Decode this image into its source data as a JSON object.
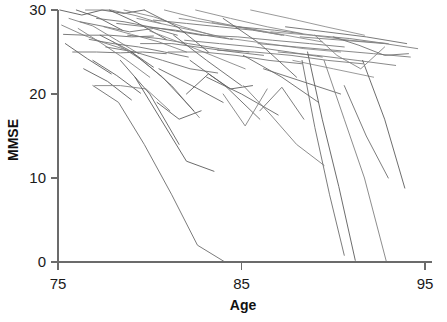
{
  "chart_data": {
    "type": "line",
    "title": "",
    "subtitle": "",
    "xlabel": "Age",
    "ylabel": "MMSE",
    "xlim": [
      75,
      95
    ],
    "ylim": [
      0,
      30
    ],
    "xticks": [
      75,
      85,
      95
    ],
    "yticks": [
      0,
      10,
      20,
      30
    ],
    "xticklabels": [
      "75",
      "85",
      "95"
    ],
    "yticklabels": [
      "0",
      "10",
      "20",
      "30"
    ],
    "grid": false,
    "legend": null,
    "legend_position": "none",
    "annotations": [],
    "line_color": "#707070",
    "line_width": 0.9,
    "n_series": 68,
    "series": [
      {
        "name": "s1",
        "x": [
          75.1,
          76.3,
          77.4,
          78.6,
          79.7
        ],
        "values": [
          30.0,
          29.4,
          30.0,
          29.6,
          30.0
        ]
      },
      {
        "name": "s2",
        "x": [
          75.2,
          76.4,
          77.5,
          78.8
        ],
        "values": [
          28.2,
          27.0,
          26.1,
          25.2
        ]
      },
      {
        "name": "s3",
        "x": [
          75.3,
          76.5,
          77.8,
          79.0,
          80.2
        ],
        "values": [
          27.1,
          27.0,
          27.0,
          26.8,
          26.9
        ]
      },
      {
        "name": "s4",
        "x": [
          75.4,
          76.6,
          77.9
        ],
        "values": [
          26.0,
          24.2,
          22.4
        ]
      },
      {
        "name": "s5",
        "x": [
          75.6,
          76.9,
          78.2,
          79.4
        ],
        "values": [
          29.0,
          28.1,
          26.4,
          24.8
        ]
      },
      {
        "name": "s6",
        "x": [
          75.8,
          77.1,
          78.4,
          79.6,
          80.9
        ],
        "values": [
          25.0,
          25.0,
          24.9,
          25.0,
          24.8
        ]
      },
      {
        "name": "s7",
        "x": [
          76.0,
          77.2,
          78.5
        ],
        "values": [
          30.0,
          29.1,
          27.6
        ]
      },
      {
        "name": "s8",
        "x": [
          76.1,
          77.4,
          78.7,
          80.0
        ],
        "values": [
          27.8,
          26.0,
          24.1,
          22.0
        ]
      },
      {
        "name": "s9",
        "x": [
          76.2,
          77.6,
          78.9,
          80.2,
          81.5
        ],
        "values": [
          28.6,
          28.0,
          27.4,
          27.8,
          27.0
        ]
      },
      {
        "name": "s10",
        "x": [
          76.4,
          77.7,
          79.0
        ],
        "values": [
          23.0,
          21.5,
          19.3
        ]
      },
      {
        "name": "s11",
        "x": [
          76.5,
          77.9,
          79.3,
          80.6
        ],
        "values": [
          30.0,
          30.0,
          29.3,
          28.4
        ]
      },
      {
        "name": "s12",
        "x": [
          76.7,
          78.0,
          79.4,
          80.8,
          82.1
        ],
        "values": [
          26.5,
          26.0,
          25.6,
          25.0,
          24.4
        ]
      },
      {
        "name": "s13",
        "x": [
          76.9,
          78.2,
          79.5
        ],
        "values": [
          24.0,
          22.2,
          20.1
        ]
      },
      {
        "name": "s14",
        "x": [
          77.0,
          78.4,
          79.8,
          81.1
        ],
        "values": [
          21.0,
          21.0,
          20.6,
          18.0
        ]
      },
      {
        "name": "s15",
        "x": [
          77.1,
          78.6,
          80.0,
          81.4,
          82.8
        ],
        "values": [
          29.0,
          28.6,
          28.0,
          27.5,
          27.0
        ]
      },
      {
        "name": "s16",
        "x": [
          77.3,
          78.8,
          80.2
        ],
        "values": [
          27.0,
          25.3,
          23.2
        ]
      },
      {
        "name": "s17",
        "x": [
          77.5,
          79.0,
          80.5,
          82.0
        ],
        "values": [
          28.0,
          27.1,
          26.2,
          25.0
        ]
      },
      {
        "name": "s18",
        "x": [
          77.6,
          79.2,
          80.7,
          82.2,
          83.7
        ],
        "values": [
          25.6,
          25.0,
          24.0,
          23.0,
          22.5
        ]
      },
      {
        "name": "s19",
        "x": [
          77.8,
          79.3,
          80.9
        ],
        "values": [
          30.0,
          28.5,
          26.5
        ]
      },
      {
        "name": "s20",
        "x": [
          78.0,
          79.6,
          81.2,
          82.7
        ],
        "values": [
          26.2,
          24.0,
          21.0,
          17.2
        ]
      },
      {
        "name": "s21",
        "x": [
          78.2,
          79.8,
          81.4,
          83.0,
          84.5
        ],
        "values": [
          28.4,
          28.0,
          27.6,
          27.0,
          26.5
        ]
      },
      {
        "name": "s22",
        "x": [
          78.4,
          80.0,
          81.6
        ],
        "values": [
          24.0,
          20.0,
          14.0
        ]
      },
      {
        "name": "s23",
        "x": [
          78.6,
          80.2,
          81.8,
          83.4
        ],
        "values": [
          30.0,
          29.2,
          28.0,
          27.0
        ]
      },
      {
        "name": "s24",
        "x": [
          78.8,
          80.5,
          82.1,
          83.8,
          85.4
        ],
        "values": [
          27.0,
          26.6,
          26.0,
          25.4,
          25.0
        ]
      },
      {
        "name": "s25",
        "x": [
          79.0,
          80.7,
          82.4
        ],
        "values": [
          25.0,
          22.0,
          18.0
        ]
      },
      {
        "name": "s26",
        "x": [
          79.3,
          81.0,
          82.7,
          84.3
        ],
        "values": [
          29.0,
          28.2,
          27.4,
          26.6
        ]
      },
      {
        "name": "s27",
        "x": [
          79.5,
          81.2,
          82.9,
          84.6,
          86.2
        ],
        "values": [
          26.0,
          26.0,
          25.5,
          25.0,
          24.6
        ]
      },
      {
        "name": "s28",
        "x": [
          79.7,
          81.5,
          83.2
        ],
        "values": [
          30.0,
          28.0,
          25.0
        ]
      },
      {
        "name": "s29",
        "x": [
          80.0,
          81.8,
          83.5,
          85.2
        ],
        "values": [
          27.5,
          26.0,
          24.5,
          23.0
        ]
      },
      {
        "name": "s30",
        "x": [
          80.2,
          82.0,
          83.8,
          85.6,
          87.3
        ],
        "values": [
          28.8,
          28.4,
          28.0,
          27.6,
          27.0
        ]
      },
      {
        "name": "s31",
        "x": [
          80.5,
          82.3,
          84.0
        ],
        "values": [
          23.0,
          21.0,
          19.0
        ]
      },
      {
        "name": "s32",
        "x": [
          80.8,
          82.6,
          84.4,
          86.2
        ],
        "values": [
          30.0,
          29.0,
          28.2,
          27.4
        ]
      },
      {
        "name": "s33",
        "x": [
          81.0,
          82.9,
          84.7,
          86.5,
          88.3
        ],
        "values": [
          25.0,
          25.0,
          24.6,
          24.0,
          23.6
        ]
      },
      {
        "name": "s34",
        "x": [
          81.3,
          83.1,
          85.0
        ],
        "values": [
          27.0,
          24.0,
          21.0
        ]
      },
      {
        "name": "s35",
        "x": [
          81.6,
          83.5,
          85.3,
          87.2
        ],
        "values": [
          29.0,
          28.4,
          27.8,
          27.0
        ]
      },
      {
        "name": "s36",
        "x": [
          81.9,
          83.8,
          85.7,
          87.6,
          89.4
        ],
        "values": [
          26.4,
          26.0,
          25.6,
          25.0,
          24.4
        ]
      },
      {
        "name": "s37",
        "x": [
          82.2,
          84.1,
          86.0
        ],
        "values": [
          24.0,
          21.0,
          17.0
        ]
      },
      {
        "name": "s38",
        "x": [
          82.5,
          84.4,
          86.4,
          88.3
        ],
        "values": [
          30.0,
          29.0,
          28.0,
          27.2
        ]
      },
      {
        "name": "s39",
        "x": [
          82.8,
          84.8,
          86.7,
          88.7,
          90.6
        ],
        "values": [
          27.0,
          26.8,
          26.4,
          26.0,
          25.6
        ]
      },
      {
        "name": "s40",
        "x": [
          83.1,
          85.0,
          87.0
        ],
        "values": [
          22.0,
          20.0,
          17.5
        ]
      },
      {
        "name": "s41",
        "x": [
          83.4,
          85.4,
          87.4,
          89.4
        ],
        "values": [
          28.5,
          27.8,
          27.0,
          26.2
        ]
      },
      {
        "name": "s42",
        "x": [
          83.7,
          85.7,
          87.7,
          89.7,
          91.6
        ],
        "values": [
          25.2,
          25.0,
          24.6,
          24.0,
          23.6
        ]
      },
      {
        "name": "s43",
        "x": [
          84.0,
          86.0,
          88.0
        ],
        "values": [
          29.0,
          26.0,
          22.0
        ]
      },
      {
        "name": "s44",
        "x": [
          84.4,
          86.4,
          88.4,
          90.4
        ],
        "values": [
          26.6,
          26.0,
          25.4,
          25.0
        ]
      },
      {
        "name": "s45",
        "x": [
          84.8,
          86.8,
          88.9,
          90.9,
          92.9
        ],
        "values": [
          28.0,
          27.6,
          27.0,
          26.6,
          26.0
        ]
      },
      {
        "name": "s46",
        "x": [
          85.1,
          87.2,
          89.2
        ],
        "values": [
          24.6,
          22.0,
          19.0
        ]
      },
      {
        "name": "s47",
        "x": [
          85.5,
          87.6,
          89.6,
          91.7
        ],
        "values": [
          30.0,
          29.0,
          28.0,
          27.0
        ]
      },
      {
        "name": "s48",
        "x": [
          85.9,
          88.0,
          90.1,
          92.2,
          94.2
        ],
        "values": [
          26.0,
          25.6,
          25.2,
          24.8,
          24.4
        ]
      },
      {
        "name": "s49",
        "x": [
          86.2,
          88.3,
          90.4
        ],
        "values": [
          23.0,
          21.5,
          20.0
        ]
      },
      {
        "name": "s50",
        "x": [
          86.6,
          88.8,
          90.9,
          93.0
        ],
        "values": [
          27.4,
          27.0,
          26.4,
          26.0
        ]
      },
      {
        "name": "s51",
        "x": [
          87.0,
          89.1,
          91.3,
          93.4
        ],
        "values": [
          25.0,
          24.6,
          24.0,
          23.4
        ]
      },
      {
        "name": "s52",
        "x": [
          87.4,
          89.6,
          91.8,
          94.0
        ],
        "values": [
          28.0,
          27.4,
          26.8,
          26.0
        ]
      },
      {
        "name": "s53",
        "x": [
          87.8,
          90.0,
          92.2
        ],
        "values": [
          24.0,
          23.0,
          22.0
        ]
      },
      {
        "name": "s54",
        "x": [
          88.2,
          90.5,
          92.8,
          94.6
        ],
        "values": [
          26.8,
          26.4,
          26.0,
          25.4
        ]
      },
      {
        "name": "s55",
        "x": [
          76.9,
          78.3,
          79.7,
          81.2,
          82.6,
          84.1,
          85.5,
          87.0
        ],
        "values": [
          21.0,
          19.0,
          14.0,
          8.0,
          2.0,
          0.0,
          0.0,
          0.0
        ]
      },
      {
        "name": "s56",
        "x": [
          79.2,
          80.6,
          82.0,
          83.5
        ],
        "values": [
          22.0,
          17.0,
          12.0,
          10.8
        ]
      },
      {
        "name": "s57",
        "x": [
          85.1,
          86.6,
          88.0,
          89.5
        ],
        "values": [
          21.0,
          17.5,
          14.0,
          11.5
        ]
      },
      {
        "name": "s58",
        "x": [
          88.3,
          89.0,
          89.8,
          90.6
        ],
        "values": [
          24.0,
          16.0,
          8.0,
          0.8
        ]
      },
      {
        "name": "s59",
        "x": [
          88.6,
          89.4,
          90.3,
          91.2
        ],
        "values": [
          25.0,
          17.0,
          9.0,
          0.2
        ]
      },
      {
        "name": "s60",
        "x": [
          89.5,
          90.6,
          91.7,
          92.9
        ],
        "values": [
          24.0,
          17.0,
          10.0,
          0.0
        ]
      },
      {
        "name": "s61",
        "x": [
          90.6,
          91.8,
          93.0
        ],
        "values": [
          21.0,
          15.0,
          10.0
        ]
      },
      {
        "name": "s62",
        "x": [
          91.6,
          92.8,
          93.9
        ],
        "values": [
          24.0,
          17.0,
          8.8
        ]
      },
      {
        "name": "s63",
        "x": [
          84.0,
          85.2,
          86.4
        ],
        "values": [
          20.0,
          16.2,
          20.6
        ]
      },
      {
        "name": "s64",
        "x": [
          86.0,
          87.2,
          88.4
        ],
        "values": [
          18.0,
          20.8,
          17.0
        ]
      },
      {
        "name": "s65",
        "x": [
          80.4,
          81.6,
          82.8
        ],
        "values": [
          19.0,
          17.0,
          18.0
        ]
      },
      {
        "name": "s66",
        "x": [
          89.0,
          90.2,
          91.5,
          92.8
        ],
        "values": [
          27.0,
          24.6,
          23.0,
          25.6
        ]
      },
      {
        "name": "s67",
        "x": [
          90.0,
          91.4,
          92.8,
          94.1
        ],
        "values": [
          26.8,
          25.8,
          24.6,
          24.8
        ]
      },
      {
        "name": "s68",
        "x": [
          82.0,
          83.2,
          84.4,
          85.6
        ],
        "values": [
          20.0,
          22.4,
          20.6,
          21.0
        ]
      }
    ]
  },
  "axes": {
    "x_title": "Age",
    "y_title": "MMSE"
  }
}
